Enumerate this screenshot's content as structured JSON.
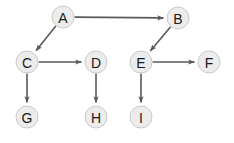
{
  "diagram": {
    "type": "directed-graph",
    "canvas": {
      "width": 234,
      "height": 143,
      "background": "#ffffff"
    },
    "style": {
      "node_fill": "#ececec",
      "node_stroke": "#c9c9c9",
      "node_radius": 11,
      "label_color": "#1a1a1a",
      "edge_color": "#595959",
      "edge_width": 1.6
    },
    "nodes": [
      {
        "id": "A",
        "label": "A",
        "x": 63,
        "y": 17
      },
      {
        "id": "B",
        "label": "B",
        "x": 178,
        "y": 18
      },
      {
        "id": "C",
        "label": "C",
        "x": 27,
        "y": 62
      },
      {
        "id": "D",
        "label": "D",
        "x": 96,
        "y": 62
      },
      {
        "id": "E",
        "label": "E",
        "x": 141,
        "y": 62
      },
      {
        "id": "F",
        "label": "F",
        "x": 209,
        "y": 62
      },
      {
        "id": "G",
        "label": "G",
        "x": 27,
        "y": 117
      },
      {
        "id": "H",
        "label": "H",
        "x": 96,
        "y": 117
      },
      {
        "id": "I",
        "label": "I",
        "x": 141,
        "y": 117
      }
    ],
    "edges": [
      {
        "from": "A",
        "to": "B",
        "direction": "right"
      },
      {
        "from": "A",
        "to": "C",
        "direction": "down-left"
      },
      {
        "from": "B",
        "to": "E",
        "direction": "down-left"
      },
      {
        "from": "C",
        "to": "D",
        "direction": "right"
      },
      {
        "from": "C",
        "to": "G",
        "direction": "down"
      },
      {
        "from": "D",
        "to": "H",
        "direction": "down"
      },
      {
        "from": "E",
        "to": "F",
        "direction": "right"
      },
      {
        "from": "E",
        "to": "I",
        "direction": "down"
      }
    ]
  }
}
